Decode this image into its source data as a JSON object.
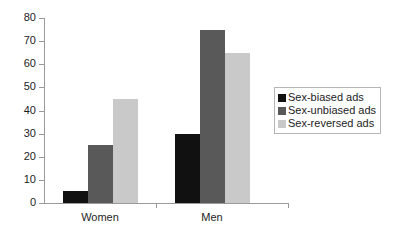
{
  "chart_data": {
    "type": "bar",
    "title": "",
    "subtitle": "",
    "xlabel": "",
    "ylabel": "",
    "categories": [
      "Women",
      "Men"
    ],
    "series": [
      {
        "name": "Sex-biased ads",
        "color": "#111111",
        "values": [
          5,
          30
        ]
      },
      {
        "name": "Sex-unbiased ads",
        "color": "#595959",
        "values": [
          25,
          75
        ]
      },
      {
        "name": "Sex-reversed ads",
        "color": "#c9c9c9",
        "values": [
          45,
          65
        ]
      }
    ],
    "ylim": [
      0,
      80
    ],
    "yticks": [
      0,
      10,
      20,
      30,
      40,
      50,
      60,
      70,
      80
    ],
    "ytick_labels": [
      "0",
      "10",
      "20",
      "30",
      "40",
      "50",
      "60",
      "70",
      "80"
    ],
    "grid": false,
    "legend_position": "right",
    "legend_border_color": "#b5b5b5",
    "axis_color": "#9a9a9a",
    "text_color": "#1d1d1d",
    "background": "#ffffff"
  }
}
